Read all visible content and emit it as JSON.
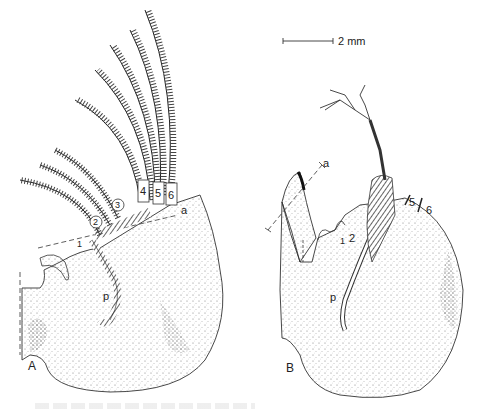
{
  "figure": {
    "scale_bar": {
      "label": "2 mm"
    },
    "panels": [
      {
        "id": "A",
        "label": "A",
        "appendage_labels": [
          "1",
          "2",
          "3",
          "4",
          "5",
          "6"
        ],
        "axis_labels": {
          "anterior": "a",
          "posterior": "p"
        }
      },
      {
        "id": "B",
        "label": "B",
        "appendage_labels": [
          "1",
          "2",
          "5",
          "6"
        ],
        "axis_labels": {
          "anterior": "a",
          "posterior": "p"
        }
      }
    ],
    "colors": {
      "ink": "#222222",
      "background": "#ffffff",
      "stipple": "#555555"
    }
  }
}
